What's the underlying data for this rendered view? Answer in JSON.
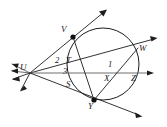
{
  "figure": {
    "canvas": {
      "width": 167,
      "height": 127
    },
    "background_color": "#ffffff",
    "stroke_color": "#1d1d1d",
    "secondary_stroke_color": "#6e6e6e"
  },
  "circle": {
    "center_x": 103,
    "center_y": 64,
    "radius": 36,
    "label": "circle"
  },
  "points": [
    {
      "id": "U",
      "label": "U",
      "x": 30,
      "y": 73,
      "marker": false,
      "label_x": 22,
      "label_y": 64
    },
    {
      "id": "V",
      "label": "V",
      "x": 73,
      "y": 37,
      "marker": true,
      "label_x": 63,
      "label_y": 26
    },
    {
      "id": "W",
      "label": "W",
      "x": 138,
      "y": 48,
      "marker": false,
      "label_x": 140,
      "label_y": 45
    },
    {
      "id": "Y",
      "label": "Y",
      "x": 94,
      "y": 100,
      "marker": true,
      "label_x": 90,
      "label_y": 103
    },
    {
      "id": "X",
      "label": "X",
      "x": 110,
      "y": 73,
      "marker": false,
      "label_x": 106,
      "label_y": 75
    },
    {
      "id": "Z",
      "label": "Z",
      "x": 133,
      "y": 73,
      "marker": false,
      "label_x": 133,
      "label_y": 75
    },
    {
      "id": "T",
      "label": "T",
      "x": 70,
      "y": 63,
      "marker": false,
      "label_x": 67,
      "label_y": 57
    },
    {
      "id": "S",
      "label": "S",
      "x": 71,
      "y": 84,
      "marker": false,
      "label_x": 67,
      "label_y": 81
    }
  ],
  "angle_labels": [
    {
      "id": "angle-2",
      "label": "2",
      "x": 56,
      "y": 57
    },
    {
      "id": "angle-3",
      "label": "3",
      "x": 64,
      "y": 68
    },
    {
      "id": "angle-1",
      "label": "1",
      "x": 109,
      "y": 61
    }
  ],
  "rays": [
    {
      "id": "ray-u-v-top",
      "from": "U",
      "through": "V",
      "arrow_end": true,
      "end_x": 106,
      "end_y": 10
    },
    {
      "id": "ray-u-w",
      "from": "U",
      "through": "W",
      "arrow_end": true,
      "end_x": 156,
      "end_y": 38
    },
    {
      "id": "ray-u-z-right",
      "from": "U",
      "through": "Z",
      "arrow_end": true,
      "end_x": 152,
      "end_y": 73
    },
    {
      "id": "ray-u-y-bottom",
      "from": "U",
      "through": "Y",
      "arrow_end": true,
      "end_x": 141,
      "end_y": 116
    }
  ],
  "chords": [
    {
      "id": "chord-v-y",
      "from": "V",
      "to": "Y"
    },
    {
      "id": "chord-w-y",
      "from": "W",
      "to": "Y"
    }
  ],
  "left_rays": [
    {
      "id": "left-ray-1",
      "end_x": 8,
      "end_y": 63
    },
    {
      "id": "left-ray-2",
      "end_x": 8,
      "end_y": 70
    },
    {
      "id": "left-ray-3",
      "end_x": 9,
      "end_y": 78
    },
    {
      "id": "left-ray-4",
      "end_x": 18,
      "end_y": 90
    }
  ]
}
